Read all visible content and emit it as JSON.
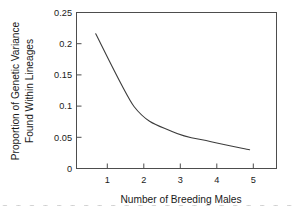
{
  "chart_data": {
    "type": "line",
    "title": "",
    "xlabel": "Number of Breeding Males",
    "ylabel": "Proportion of Genetic Variance Found Within Lineages",
    "ylabel_line1": "Proportion of Genetic Variance",
    "ylabel_line2": "Found Within Lineages",
    "x": [
      1,
      2,
      3,
      4,
      5
    ],
    "values": [
      0.216,
      0.099,
      0.059,
      0.043,
      0.03
    ],
    "xtick_labels": [
      "1",
      "2",
      "3",
      "4",
      "5"
    ],
    "ytick_labels": [
      "0",
      "0.05",
      "0.1",
      "0.15",
      "0.2",
      "0.25"
    ],
    "ytick_values": [
      0,
      0.05,
      0.1,
      0.15,
      0.2,
      0.25
    ],
    "xlim": [
      0.5,
      5.7
    ],
    "ylim": [
      0,
      0.25
    ],
    "grid": false,
    "legend": false,
    "line_color": "#3c3c3c",
    "axis_color": "#4d4d4d",
    "background_color": "#ffffff"
  },
  "artifact": {
    "bottom_text": "1 1 1 1 1 1 1 1 1 1 1 1 1 1 1 1 1 1 1 1 1 1 1 1 1 1 1 1"
  }
}
